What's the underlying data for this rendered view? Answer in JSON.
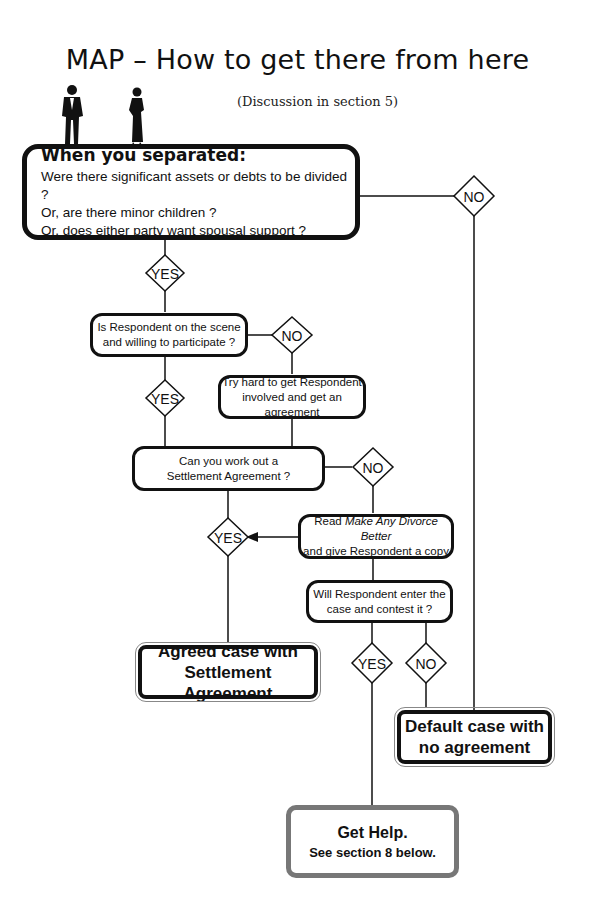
{
  "header": {
    "title": "MAP – How to get there from here",
    "subtitle": "(Discussion in section 5)"
  },
  "figures": [
    "man-silhouette",
    "woman-silhouette"
  ],
  "start_box": {
    "heading": "When you separated:",
    "lines": [
      "Were there significant assets or debts to be divided ?",
      "Or, are there minor children ?",
      "Or, does either party want spousal support ?"
    ]
  },
  "decisions": {
    "d1_no": "NO",
    "d1_yes": "YES",
    "d2_no": "NO",
    "d2_yes": "YES",
    "d3_no": "NO",
    "d3_yes": "YES",
    "d4_yes": "YES",
    "d4_no": "NO"
  },
  "boxes": {
    "respondent_scene": {
      "line1": "Is Respondent on the scene",
      "line2": "and willing to participate ?"
    },
    "try_hard": {
      "line1": "Try hard to get Respondent",
      "line2": "involved and get an agreement"
    },
    "work_out": {
      "line1": "Can you work out a",
      "line2": "Settlement Agreement ?"
    },
    "read_book": {
      "prefix": "Read ",
      "italic": "Make Any Divorce Better",
      "line2": "and give Respondent a copy"
    },
    "contest": {
      "line1": "Will Respondent enter the",
      "line2": "case and contest it ?"
    }
  },
  "outcomes": {
    "agreed": {
      "line1": "Agreed case with",
      "line2": "Settlement Agreement"
    },
    "default": {
      "line1": "Default case with",
      "line2": "no agreement"
    },
    "help": {
      "line1": "Get Help.",
      "line2": "See section 8 below."
    }
  },
  "colors": {
    "line": "#111111",
    "help_border": "#777777",
    "background": "#ffffff"
  }
}
